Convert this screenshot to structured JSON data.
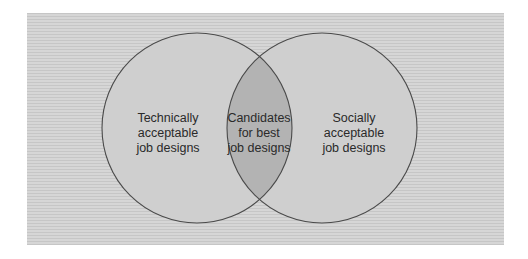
{
  "diagram": {
    "type": "venn",
    "colors": {
      "page_background": "#ffffff",
      "panel_background": "#cdcdcd",
      "circle_fill": "#cfcfcf",
      "intersection_fill": "#b3b3b3",
      "circle_stroke": "#4a4a4a",
      "text": "#2a2a2a"
    },
    "sets": [
      {
        "id": "technical",
        "lines": [
          "Technically",
          "acceptable",
          "job designs"
        ]
      },
      {
        "id": "social",
        "lines": [
          "Socially",
          "acceptable",
          "job designs"
        ]
      }
    ],
    "intersection": {
      "lines": [
        "Candidates",
        "for best",
        "job designs"
      ]
    }
  }
}
